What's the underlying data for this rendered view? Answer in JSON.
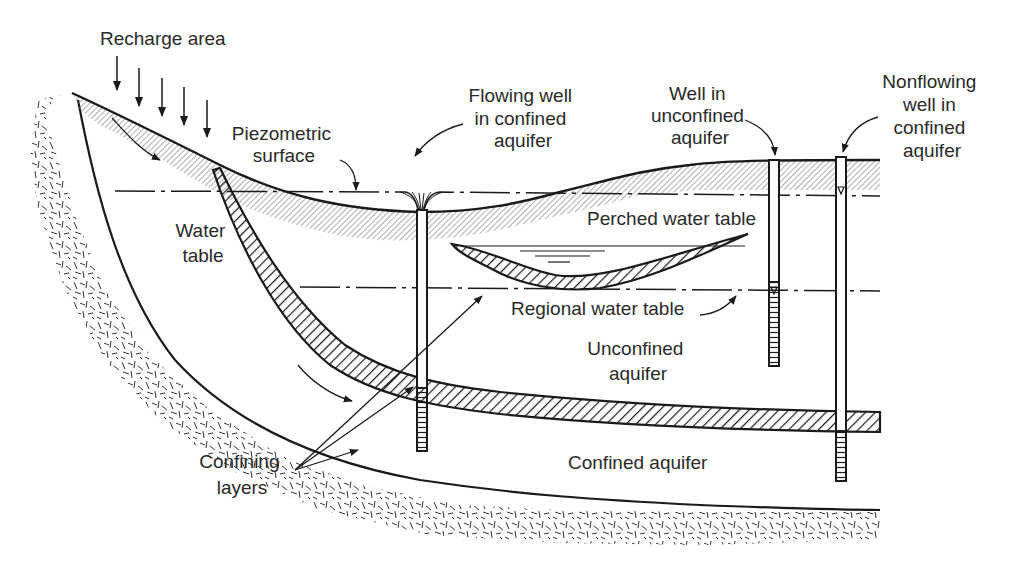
{
  "diagram": {
    "type": "aquifer cross-section",
    "labels": {
      "recharge_area": "Recharge area",
      "piezometric_surface": [
        "Piezometric",
        "surface"
      ],
      "water_table": [
        "Water",
        "table"
      ],
      "flowing_well": [
        "Flowing well",
        "in confined",
        "aquifer"
      ],
      "well_unconfined": [
        "Well in",
        "unconfined",
        "aquifer"
      ],
      "nonflowing_well": [
        "Nonflowing",
        "well in",
        "confined",
        "aquifer"
      ],
      "perched_water_table": "Perched water table",
      "regional_water_table": "Regional water table",
      "unconfined_aquifer": [
        "Unconfined",
        "aquifer"
      ],
      "confined_aquifer": "Confined aquifer",
      "confining_layers": [
        "Confining",
        "layers"
      ]
    },
    "recharge_arrows": 5,
    "wells": [
      {
        "name": "Flowing well in confined aquifer",
        "x": 421
      },
      {
        "name": "Well in unconfined aquifer",
        "x": 775
      },
      {
        "name": "Nonflowing well in confined aquifer",
        "x": 840
      }
    ],
    "colors": {
      "line": "#1a1a1a",
      "text": "#2a2a2a",
      "shade": "#8a8a8a",
      "background": "#ffffff"
    }
  }
}
